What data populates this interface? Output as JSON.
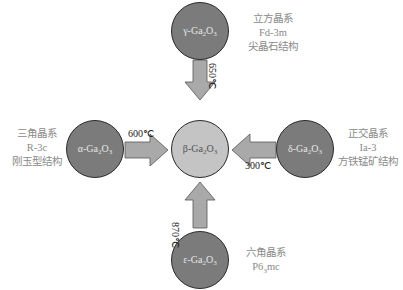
{
  "diagram": {
    "center": {
      "name": "β-Ga2O3",
      "prefix": "β-Ga",
      "sub1": "2",
      "mid": "O",
      "sub2": "3"
    },
    "phases": [
      {
        "id": "gamma",
        "prefix": "γ-Ga",
        "sub1": "2",
        "mid": "O",
        "sub2": "3",
        "system": "立方晶系",
        "space_group": "Fd-3m",
        "structure": "尖晶石结构",
        "transition_temp": "650℃"
      },
      {
        "id": "alpha",
        "prefix": "α-Ga",
        "sub1": "2",
        "mid": "O",
        "sub2": "3",
        "system": "三角晶系",
        "space_group": "R-3c",
        "structure": "刚玉型结构",
        "transition_temp": "600℃"
      },
      {
        "id": "delta",
        "prefix": "δ-Ga",
        "sub1": "2",
        "mid": "O",
        "sub2": "3",
        "system": "正交晶系",
        "space_group": "Ia-3",
        "structure": "方铁锰矿结构",
        "transition_temp": "300℃"
      },
      {
        "id": "epsilon",
        "prefix": "ε-Ga",
        "sub1": "2",
        "mid": "O",
        "sub2": "3",
        "system": "六角晶系",
        "space_group": "P63mc",
        "space_group_prefix": "P6",
        "space_group_sub": "3",
        "space_group_suffix": "mc",
        "transition_temp": "870℃"
      }
    ],
    "colors": {
      "phase_fill": "#7b7b7b",
      "center_fill": "#c4c4c4",
      "arrow_fill": "#a9a9a9",
      "label_text": "#8a8a8a"
    }
  }
}
